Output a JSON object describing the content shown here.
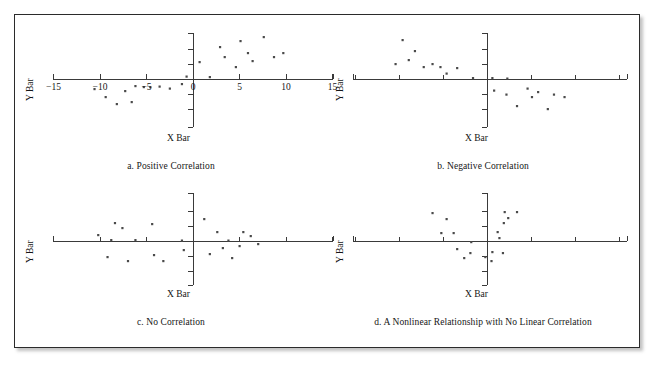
{
  "figure": {
    "panel_count": 4,
    "axis_color": "#3a3a3a",
    "dot_color": "#4a4a4a",
    "border_color": "#2b2b2b"
  },
  "panels": [
    {
      "id": "a",
      "caption": "a. Positive Correlation",
      "y_axis_label": "Y Bar",
      "x_axis_label": "X Bar",
      "tick_labels": [
        "-15",
        "-10",
        "-5",
        "0",
        "5",
        "10",
        "15"
      ],
      "tick_values": [
        -15,
        -10,
        -5,
        0,
        5,
        10,
        15
      ]
    },
    {
      "id": "b",
      "caption": "b. Negative Correlation",
      "y_axis_label": "Y Bar",
      "x_axis_label": "X Bar",
      "tick_labels": [],
      "tick_values": [
        -15,
        -10,
        -5,
        0,
        5,
        10,
        15
      ]
    },
    {
      "id": "c",
      "caption": "c. No Correlation",
      "y_axis_label": "Y Bar",
      "x_axis_label": "X Bar",
      "tick_labels": [],
      "tick_values": [
        -15,
        -10,
        -5,
        0,
        5,
        10,
        15
      ]
    },
    {
      "id": "d",
      "caption": "d. A Nonlinear Relationship with No Linear Correlation",
      "y_axis_label": "Y Bar",
      "x_axis_label": "X Bar",
      "tick_labels": [],
      "tick_values": [
        -15,
        -10,
        -5,
        0,
        5,
        10,
        15
      ]
    }
  ],
  "chart_data": [
    {
      "type": "scatter",
      "title": "a. Positive Correlation",
      "xlabel": "X Bar",
      "ylabel": "Y Bar",
      "xlim": [
        -15,
        15
      ],
      "ylim": [
        -9,
        9
      ],
      "xticks": [
        -15,
        -10,
        -5,
        0,
        5,
        10,
        15
      ],
      "xticklabels": [
        "-15",
        "-10",
        "-5",
        "0",
        "5",
        "10",
        "15"
      ],
      "grid": false,
      "legend": false,
      "points": [
        [
          -10.6,
          -2.0
        ],
        [
          -9.4,
          -3.6
        ],
        [
          -8.2,
          -5.0
        ],
        [
          -7.3,
          -2.4
        ],
        [
          -6.6,
          -4.6
        ],
        [
          -6.2,
          -1.4
        ],
        [
          -5.3,
          -1.6
        ],
        [
          -4.6,
          -1.6
        ],
        [
          -3.6,
          -1.5
        ],
        [
          -2.5,
          -1.9
        ],
        [
          -1.2,
          -1.0
        ],
        [
          -0.7,
          0.5
        ],
        [
          0.7,
          3.4
        ],
        [
          1.8,
          0.4
        ],
        [
          2.9,
          6.4
        ],
        [
          3.4,
          4.4
        ],
        [
          4.6,
          2.4
        ],
        [
          5.1,
          7.6
        ],
        [
          5.9,
          5.2
        ],
        [
          6.4,
          3.6
        ],
        [
          7.6,
          8.4
        ],
        [
          8.7,
          4.4
        ],
        [
          9.7,
          5.2
        ]
      ],
      "n_points": 23
    },
    {
      "type": "scatter",
      "title": "b. Negative Correlation",
      "xlabel": "X Bar",
      "ylabel": "Y Bar",
      "xlim": [
        -15,
        15
      ],
      "ylim": [
        -9,
        9
      ],
      "xticks": [
        -15,
        -10,
        -5,
        0,
        5,
        10,
        15
      ],
      "xticklabels": [],
      "grid": false,
      "legend": false,
      "points": [
        [
          -9.6,
          7.8
        ],
        [
          -8.2,
          5.6
        ],
        [
          -8.9,
          3.8
        ],
        [
          -10.4,
          3.0
        ],
        [
          -7.2,
          2.4
        ],
        [
          -6.2,
          3.0
        ],
        [
          -5.3,
          2.4
        ],
        [
          -4.6,
          1.1
        ],
        [
          -3.4,
          2.2
        ],
        [
          -1.6,
          0.2
        ],
        [
          0.6,
          0.2
        ],
        [
          2.3,
          0.1
        ],
        [
          0.8,
          -2.3
        ],
        [
          2.2,
          -3.1
        ],
        [
          3.4,
          -5.4
        ],
        [
          4.6,
          -1.9
        ],
        [
          5.1,
          -3.6
        ],
        [
          5.8,
          -2.6
        ],
        [
          6.9,
          -6.0
        ],
        [
          7.6,
          -3.1
        ],
        [
          8.8,
          -3.6
        ]
      ],
      "n_points": 21
    },
    {
      "type": "scatter",
      "title": "c. No Correlation",
      "xlabel": "X Bar",
      "ylabel": "Y Bar",
      "xlim": [
        -15,
        15
      ],
      "ylim": [
        -9,
        9
      ],
      "xticks": [
        -15,
        -10,
        -5,
        0,
        5,
        10,
        15
      ],
      "xticklabels": [],
      "grid": false,
      "legend": false,
      "points": [
        [
          -10.2,
          1.2
        ],
        [
          -9.2,
          -3.2
        ],
        [
          -8.4,
          3.6
        ],
        [
          -7.6,
          2.6
        ],
        [
          -8.8,
          0.2
        ],
        [
          -7.0,
          -4.0
        ],
        [
          -6.2,
          0.2
        ],
        [
          -4.4,
          3.4
        ],
        [
          -4.2,
          -2.8
        ],
        [
          -3.2,
          -4.0
        ],
        [
          -1.2,
          0.1
        ],
        [
          -1.0,
          -1.8
        ],
        [
          1.2,
          4.4
        ],
        [
          1.8,
          -2.6
        ],
        [
          2.6,
          1.8
        ],
        [
          3.2,
          -1.4
        ],
        [
          3.8,
          0.1
        ],
        [
          4.2,
          -3.4
        ],
        [
          5.4,
          1.8
        ],
        [
          5.0,
          -1.0
        ],
        [
          6.2,
          1.0
        ],
        [
          7.0,
          -0.6
        ]
      ],
      "n_points": 22
    },
    {
      "type": "scatter",
      "title": "d. A Nonlinear Relationship with No Linear Correlation",
      "xlabel": "X Bar",
      "ylabel": "Y Bar",
      "xlim": [
        -15,
        15
      ],
      "ylim": [
        -9,
        9
      ],
      "xticks": [
        -15,
        -10,
        -5,
        0,
        5,
        10,
        15
      ],
      "xticklabels": [],
      "grid": false,
      "legend": false,
      "points": [
        [
          -6.2,
          5.6
        ],
        [
          -4.6,
          4.4
        ],
        [
          -5.2,
          1.6
        ],
        [
          -3.8,
          1.6
        ],
        [
          -3.4,
          -1.6
        ],
        [
          -2.6,
          -3.4
        ],
        [
          -1.9,
          -2.4
        ],
        [
          -1.8,
          -0.2
        ],
        [
          -0.2,
          -3.2
        ],
        [
          0.6,
          -2.2
        ],
        [
          0.5,
          -4.0
        ],
        [
          1.8,
          -2.4
        ],
        [
          1.2,
          1.8
        ],
        [
          1.4,
          0.6
        ],
        [
          1.9,
          3.6
        ],
        [
          2.4,
          4.6
        ],
        [
          2.0,
          5.8
        ],
        [
          3.4,
          5.8
        ]
      ],
      "n_points": 18
    }
  ]
}
